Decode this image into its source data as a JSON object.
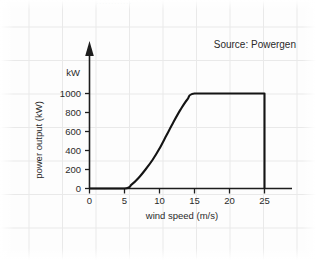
{
  "figure": {
    "source_note": "Source: Powergen",
    "top_clipped_text": "............",
    "y_unit_label": "kW",
    "axis_color": "#1d1d1d",
    "curve_color": "#141414",
    "grid_color": "#e9e9e9",
    "background_color": "#fdfdfd"
  },
  "chart_data": {
    "type": "line",
    "title": "",
    "subtitle": "",
    "annotations": [
      "Source: Powergen"
    ],
    "xlabel": "wind speed (m/s)",
    "ylabel": "power output (kW)",
    "y_unit": "kW",
    "xlim": [
      0,
      27
    ],
    "ylim": [
      0,
      1100
    ],
    "xticks": [
      0,
      5,
      10,
      15,
      20,
      25
    ],
    "xtick_labels": [
      "0",
      "5",
      "10",
      "15",
      "20",
      "25"
    ],
    "yticks": [
      0,
      200,
      400,
      600,
      800,
      1000
    ],
    "ytick_labels": [
      "0",
      "200",
      "400",
      "600",
      "800",
      "1000"
    ],
    "grid": false,
    "legend": null,
    "series": [
      {
        "name": "wind turbine power curve",
        "x": [
          0,
          5,
          6,
          7,
          8,
          9,
          10,
          11,
          12,
          13,
          14,
          15,
          20,
          25,
          25
        ],
        "values": [
          0,
          0,
          40,
          110,
          200,
          300,
          420,
          560,
          700,
          830,
          940,
          1000,
          1000,
          1000,
          0
        ]
      }
    ],
    "features": {
      "cut_in_speed": 5,
      "rated_speed": 15,
      "rated_power": 1000,
      "cut_out_speed": 25
    }
  }
}
